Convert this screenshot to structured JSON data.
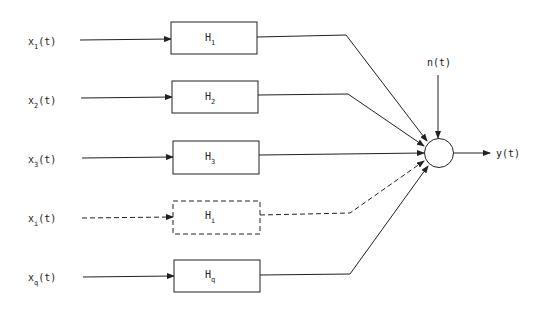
{
  "diagram": {
    "type": "block-diagram",
    "branches": [
      {
        "input": "x",
        "input_sub": "1",
        "input_suffix": "(t)",
        "block": "H",
        "block_sub": "1",
        "style": "solid"
      },
      {
        "input": "x",
        "input_sub": "2",
        "input_suffix": "(t)",
        "block": "H",
        "block_sub": "2",
        "style": "solid"
      },
      {
        "input": "x",
        "input_sub": "3",
        "input_suffix": "(t)",
        "block": "H",
        "block_sub": "3",
        "style": "solid"
      },
      {
        "input": "x",
        "input_sub": "i",
        "input_suffix": "(t)",
        "block": "H",
        "block_sub": "i",
        "style": "dashed"
      },
      {
        "input": "x",
        "input_sub": "q",
        "input_suffix": "(t)",
        "block": "H",
        "block_sub": "q",
        "style": "solid"
      }
    ],
    "summing_junction": {
      "shape": "circle"
    },
    "noise": {
      "label": "n(t)"
    },
    "output": {
      "label": "y(t)"
    }
  }
}
